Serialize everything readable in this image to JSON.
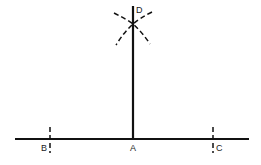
{
  "diagram": {
    "title": "",
    "colors": {
      "line": "#111111",
      "label": "#222222",
      "background": "#ffffff"
    },
    "labels": {
      "A": "A",
      "B": "B",
      "C": "C",
      "D": "D"
    },
    "points": {
      "A": {
        "x": 133,
        "y": 139
      },
      "B": {
        "x": 50,
        "y": 139
      },
      "C": {
        "x": 213,
        "y": 139
      },
      "D": {
        "x": 133,
        "y": 24
      }
    },
    "elements": [
      {
        "type": "line",
        "name": "base-line",
        "from": [
          15,
          139
        ],
        "to": [
          249,
          139
        ]
      },
      {
        "type": "line",
        "name": "perpendicular-line",
        "from": [
          133,
          6
        ],
        "to": [
          133,
          139
        ]
      },
      {
        "type": "tick",
        "name": "tick-B",
        "at": [
          50,
          139
        ],
        "style": "dashed"
      },
      {
        "type": "tick",
        "name": "tick-C",
        "at": [
          213,
          139
        ],
        "style": "dashed"
      },
      {
        "type": "arc",
        "name": "arc-from-B",
        "style": "dashed"
      },
      {
        "type": "arc",
        "name": "arc-from-C",
        "style": "dashed"
      }
    ]
  }
}
